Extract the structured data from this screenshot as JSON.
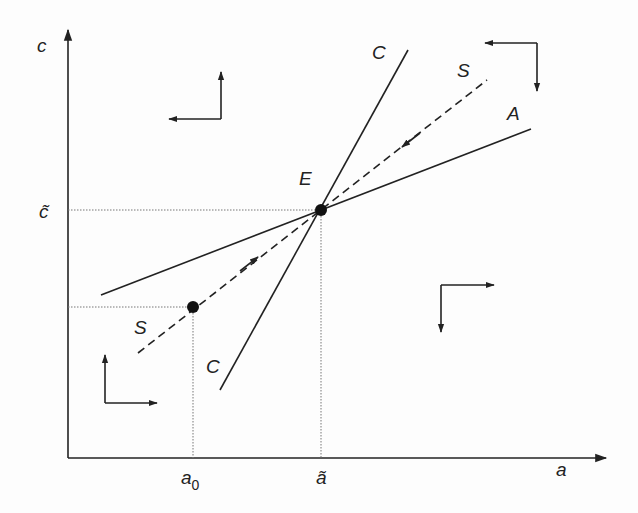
{
  "diagram": {
    "title": "",
    "axes": {
      "x_label": "a",
      "y_label": "c",
      "x_ticks": [
        {
          "label": "a",
          "subscript": "0",
          "x": 193
        },
        {
          "label": "ã",
          "subscript": "",
          "x": 321
        }
      ],
      "y_ticks": [
        {
          "label": "c̃",
          "y": 210
        }
      ]
    },
    "curves": [
      {
        "name": "C",
        "style": "solid",
        "label_top": "C",
        "label_bottom": "C"
      },
      {
        "name": "A",
        "style": "solid",
        "label": "A"
      },
      {
        "name": "S",
        "style": "dashed",
        "label_top": "S",
        "label_bottom": "S",
        "description": "saddle path"
      }
    ],
    "points": [
      {
        "name": "E",
        "label": "E",
        "description": "steady state equilibrium"
      },
      {
        "name": "initial",
        "label": "",
        "description": "initial point at a0"
      }
    ],
    "direction_arrows": [
      {
        "region": "upper-left",
        "horizontal": "left",
        "vertical": "up"
      },
      {
        "region": "upper-right",
        "horizontal": "left",
        "vertical": "down"
      },
      {
        "region": "lower-right",
        "horizontal": "right",
        "vertical": "down"
      },
      {
        "region": "lower-left",
        "horizontal": "right",
        "vertical": "up"
      }
    ],
    "colors": {
      "ink": "#222222",
      "guide": "#666666",
      "background": "#fdfdfd"
    }
  }
}
